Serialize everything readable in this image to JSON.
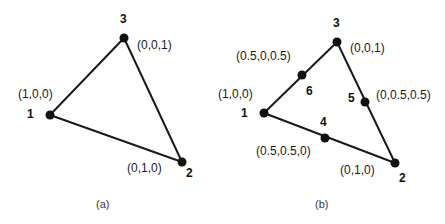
{
  "figure": {
    "type": "diagram",
    "background_color": "#ffffff",
    "line_color": "#1a1a1a",
    "node_color": "#111111"
  },
  "panels": [
    {
      "id": "a",
      "caption": "(a)",
      "caption_pos": {
        "x": 96,
        "y": 198
      },
      "nodes": [
        {
          "id": "n1",
          "number": "1",
          "coord_label": "(1,0,0)",
          "x": 50,
          "y": 115,
          "num_pos": {
            "x": 27,
            "y": 108
          },
          "coord_pos": {
            "x": 18,
            "y": 88
          }
        },
        {
          "id": "n2",
          "number": "2",
          "coord_label": "(0,1,0)",
          "x": 182,
          "y": 162,
          "num_pos": {
            "x": 186,
            "y": 167
          },
          "coord_pos": {
            "x": 127,
            "y": 162
          }
        },
        {
          "id": "n3",
          "number": "3",
          "coord_label": "(0,0,1)",
          "x": 124,
          "y": 38,
          "num_pos": {
            "x": 120,
            "y": 13
          },
          "coord_pos": {
            "x": 137,
            "y": 39
          }
        }
      ],
      "edges": [
        {
          "from": "n1",
          "to": "n3"
        },
        {
          "from": "n3",
          "to": "n2"
        },
        {
          "from": "n1",
          "to": "n2"
        }
      ]
    },
    {
      "id": "b",
      "caption": "(b)",
      "caption_pos": {
        "x": 315,
        "y": 198
      },
      "nodes": [
        {
          "id": "m1",
          "number": "1",
          "coord_label": "(1,0,0)",
          "x": 264,
          "y": 113,
          "num_pos": {
            "x": 241,
            "y": 107
          },
          "coord_pos": {
            "x": 218,
            "y": 88
          }
        },
        {
          "id": "m2",
          "number": "2",
          "coord_label": "(0,1,0)",
          "x": 395,
          "y": 163,
          "num_pos": {
            "x": 399,
            "y": 172
          },
          "coord_pos": {
            "x": 340,
            "y": 164
          }
        },
        {
          "id": "m3",
          "number": "3",
          "coord_label": "(0,0,1)",
          "x": 337,
          "y": 42,
          "num_pos": {
            "x": 333,
            "y": 17
          },
          "coord_pos": {
            "x": 350,
            "y": 42
          }
        },
        {
          "id": "m4",
          "number": "4",
          "coord_label": "(0.5,0.5,0)",
          "x": 325,
          "y": 138,
          "num_pos": {
            "x": 320,
            "y": 116
          },
          "coord_pos": {
            "x": 256,
            "y": 145
          }
        },
        {
          "id": "m5",
          "number": "5",
          "coord_label": "(0,0.5,0.5)",
          "x": 365,
          "y": 102,
          "num_pos": {
            "x": 348,
            "y": 92
          },
          "coord_pos": {
            "x": 376,
            "y": 89
          }
        },
        {
          "id": "m6",
          "number": "6",
          "coord_label": "(0.5,0,0.5)",
          "x": 302,
          "y": 75,
          "num_pos": {
            "x": 306,
            "y": 85
          },
          "coord_pos": {
            "x": 236,
            "y": 50
          }
        }
      ],
      "edges": [
        {
          "from": "m1",
          "to": "m3"
        },
        {
          "from": "m3",
          "to": "m2"
        },
        {
          "from": "m1",
          "to": "m2"
        }
      ]
    }
  ]
}
